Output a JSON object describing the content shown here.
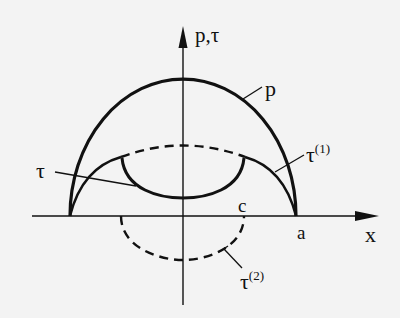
{
  "diagram": {
    "type": "contact-pressure-shear-stress-distribution",
    "colors": {
      "background": "#f3f3f3",
      "ink": "#111111"
    },
    "axes": {
      "x_label": "x",
      "y_label": "p,τ"
    },
    "markers": {
      "c_label": "c",
      "a_label": "a"
    },
    "curves": {
      "p": {
        "label": "p",
        "style": "solid-thick",
        "description": "semi-elliptical pressure distribution from -a to a"
      },
      "tau": {
        "label": "τ",
        "style": "solid-thick",
        "description": "resulting shear stress: τ(1) outside stick zone, τ(1)+τ(2) inside |x|<c"
      },
      "tau1": {
        "label": "τ",
        "superscript": "(1)",
        "style": "solid-thin-with-dashed-center",
        "description": "full-sliding shear traction, proportional to p"
      },
      "tau2": {
        "label": "τ",
        "superscript": "(2)",
        "style": "dashed",
        "description": "corrective negative traction over stick zone |x|<c"
      }
    }
  }
}
